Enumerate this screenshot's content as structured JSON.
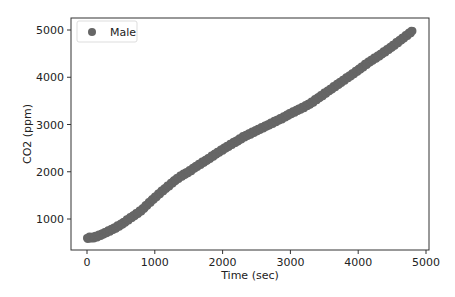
{
  "chart_data": {
    "type": "scatter",
    "title": "",
    "xlabel": "Time (sec)",
    "ylabel": "CO2  (ppm)",
    "xlim": [
      -250,
      5150
    ],
    "ylim": [
      350,
      5250
    ],
    "xticks": [
      0,
      1000,
      2000,
      3000,
      4000,
      5000
    ],
    "yticks": [
      1000,
      2000,
      3000,
      4000,
      5000
    ],
    "grid": false,
    "legend_position": "upper left",
    "series": [
      {
        "name": "Male",
        "color": "#666666",
        "x": [
          0,
          100,
          200,
          300,
          400,
          500,
          600,
          700,
          800,
          900,
          1000,
          1100,
          1200,
          1300,
          1400,
          1500,
          1600,
          1700,
          1800,
          1900,
          2000,
          2100,
          2200,
          2300,
          2400,
          2500,
          2600,
          2700,
          2800,
          2900,
          3000,
          3100,
          3200,
          3300,
          3400,
          3500,
          3600,
          3700,
          3800,
          3900,
          4000,
          4100,
          4200,
          4300,
          4400,
          4500,
          4600,
          4700,
          4800
        ],
        "y": [
          600,
          610,
          660,
          730,
          800,
          880,
          980,
          1080,
          1180,
          1320,
          1450,
          1580,
          1700,
          1820,
          1920,
          2000,
          2100,
          2190,
          2280,
          2380,
          2470,
          2560,
          2640,
          2730,
          2800,
          2870,
          2940,
          3010,
          3080,
          3150,
          3230,
          3300,
          3370,
          3450,
          3550,
          3650,
          3750,
          3850,
          3950,
          4050,
          4150,
          4260,
          4360,
          4450,
          4550,
          4650,
          4760,
          4870,
          4980
        ]
      }
    ]
  },
  "legend": {
    "items": [
      {
        "label": "Male",
        "color": "#666666"
      }
    ]
  },
  "axes": {
    "xlabel": "Time (sec)",
    "ylabel": "CO2  (ppm)",
    "xtick_labels": [
      "0",
      "1000",
      "2000",
      "3000",
      "4000",
      "5000"
    ],
    "ytick_labels": [
      "1000",
      "2000",
      "3000",
      "4000",
      "5000"
    ]
  }
}
